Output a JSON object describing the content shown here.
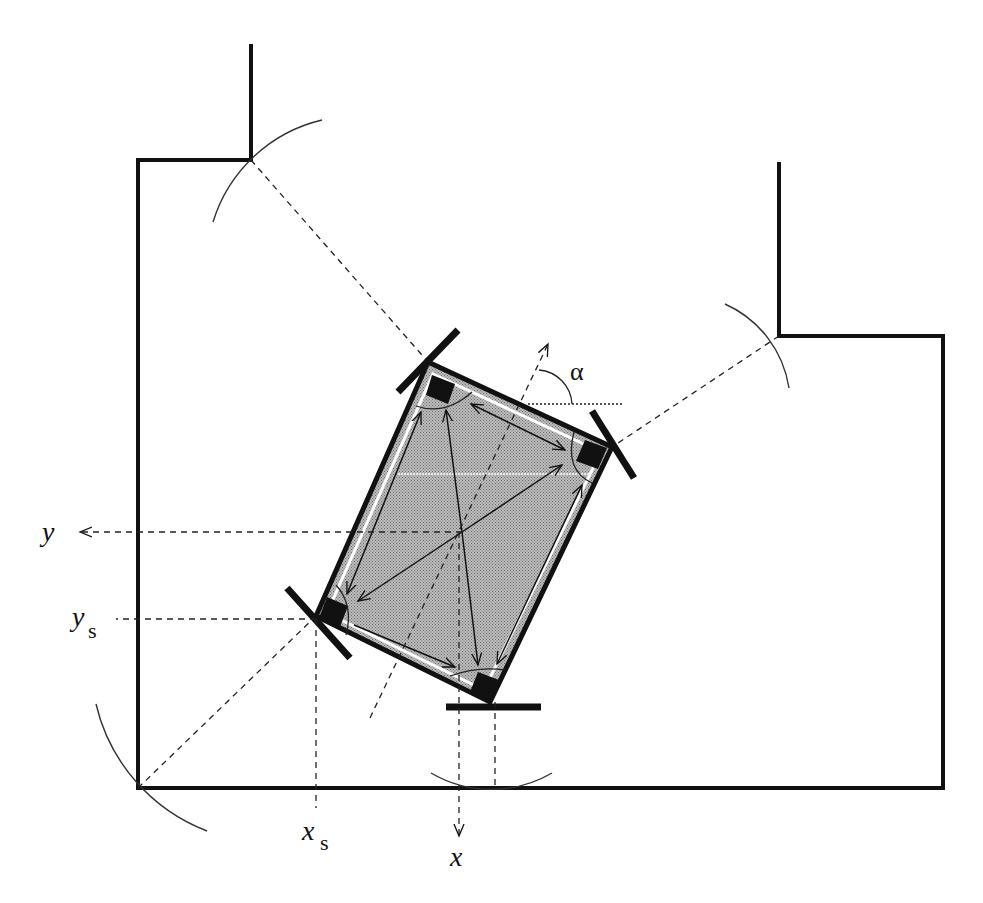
{
  "diagram": {
    "type": "robot-localization-geometry",
    "labels": {
      "y_axis": "y",
      "y_s": "y",
      "y_s_sub": "s",
      "x_axis": "x",
      "x_s": "x",
      "x_s_sub": "s",
      "alpha": "α"
    },
    "colors": {
      "stroke": "#111111",
      "robot_fill": "#a8a8a8",
      "background": "#ffffff",
      "sensor": "#111111"
    },
    "room": {
      "wall_path": [
        [
          251,
          44
        ],
        [
          251,
          160
        ],
        [
          138,
          160
        ],
        [
          138,
          788
        ],
        [
          943,
          788
        ],
        [
          943,
          336
        ],
        [
          779,
          336
        ],
        [
          779,
          162
        ]
      ],
      "corners": [
        {
          "name": "upper-left-notch",
          "x": 251,
          "y": 160
        },
        {
          "name": "upper-right-notch",
          "x": 779,
          "y": 336
        },
        {
          "name": "lower-left",
          "x": 138,
          "y": 788
        }
      ]
    },
    "robot": {
      "corners": [
        [
          428,
          362
        ],
        [
          612,
          447
        ],
        [
          490,
          702
        ],
        [
          316,
          616
        ]
      ],
      "center": [
        462,
        532
      ],
      "heading_angle_label": "α"
    }
  }
}
